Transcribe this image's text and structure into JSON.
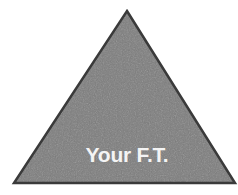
{
  "figure": {
    "name": "gray-triangle-diagram",
    "background_color": "#ffffff",
    "canvas": {
      "width": 238,
      "height": 195
    },
    "shape": {
      "type": "triangle",
      "name": "triangle-shape",
      "fill_color": "#787878",
      "fill_texture": "mottled-scanned-gray",
      "stroke_color": "#3a3a3a",
      "stroke_width": 2.5,
      "points": [
        {
          "x": 127,
          "y": 11
        },
        {
          "x": 235,
          "y": 183
        },
        {
          "x": 14,
          "y": 183
        }
      ],
      "apex": {
        "x": 127,
        "y": 11
      },
      "bottom_left": {
        "x": 14,
        "y": 183
      },
      "bottom_right": {
        "x": 235,
        "y": 183
      }
    },
    "label": {
      "text": "Your F.T.",
      "color": "#f4f4f4",
      "font_weight": "bold",
      "font_size_px": 21,
      "center_x": 127,
      "baseline_y": 162
    }
  }
}
